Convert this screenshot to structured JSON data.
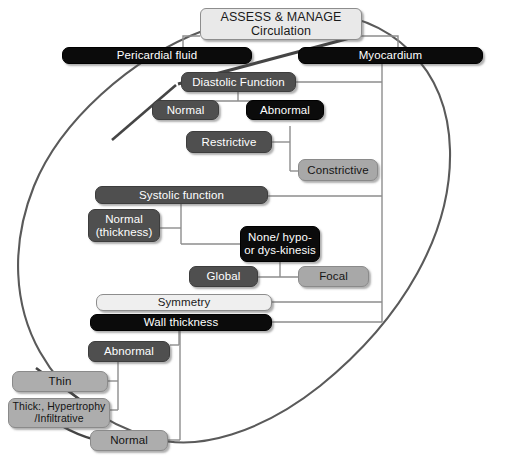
{
  "diagram": {
    "title": "ASSESS & MANAGE Circulation",
    "root": {
      "line1": "ASSESS & MANAGE",
      "line2": "Circulation"
    },
    "nodes": [
      {
        "id": "pericardial-fluid",
        "label": "Pericardial fluid"
      },
      {
        "id": "myocardium",
        "label": "Myocardium"
      },
      {
        "id": "diastolic-function",
        "label": "Diastolic Function"
      },
      {
        "id": "diastolic-normal",
        "label": "Normal"
      },
      {
        "id": "diastolic-abnormal",
        "label": "Abnormal"
      },
      {
        "id": "restrictive",
        "label": "Restrictive"
      },
      {
        "id": "constrictive",
        "label": "Constrictive"
      },
      {
        "id": "systolic-function",
        "label": "Systolic function"
      },
      {
        "id": "systolic-normal",
        "label": "Normal\n(thickness)"
      },
      {
        "id": "none-hypo-dyskinesis",
        "label": "None/ hypo-\nor dys-kinesis"
      },
      {
        "id": "global",
        "label": "Global"
      },
      {
        "id": "focal",
        "label": "Focal"
      },
      {
        "id": "symmetry",
        "label": "Symmetry"
      },
      {
        "id": "wall-thickness",
        "label": "Wall thickness"
      },
      {
        "id": "wall-abnormal",
        "label": "Abnormal"
      },
      {
        "id": "thin",
        "label": "Thin"
      },
      {
        "id": "thick-hypertrophy",
        "label": "Thick:, Hypertrophy\n/Infiltrative"
      },
      {
        "id": "wall-normal",
        "label": "Normal"
      }
    ],
    "colors": {
      "root_fill": "#e9e9e9",
      "black_fill": "#0b0b0b",
      "dark_fill": "#4f4f4f",
      "grey_fill": "#a8a8a8",
      "light_fill": "#efefef",
      "connector": "#8d8d8d",
      "ellipse": "#5a5a5a",
      "text_on_dark": "#ffffff",
      "text_on_light": "#1a1a1a",
      "background": "#ffffff"
    },
    "caption": ""
  }
}
